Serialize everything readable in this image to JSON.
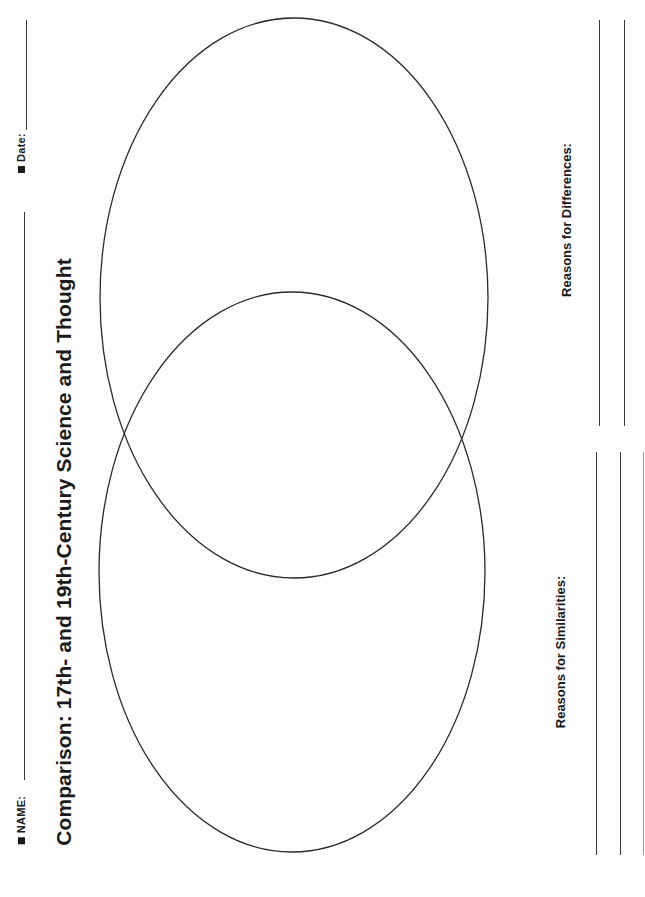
{
  "header": {
    "name_label": "NAME:",
    "date_label": "Date:"
  },
  "title": "Comparison: 17th- and 19th-Century Science and Thought",
  "venn": {
    "circles": [
      {
        "id": "top",
        "cx": 294,
        "cy": 298,
        "rx": 194,
        "ry": 280
      },
      {
        "id": "bottom",
        "cx": 292,
        "cy": 572,
        "rx": 193,
        "ry": 280
      }
    ],
    "stroke_color": "#2b2b2b"
  },
  "sections": {
    "differences_label": "Reasons for Differences:",
    "similarities_label": "Reasons for Similarities:"
  }
}
